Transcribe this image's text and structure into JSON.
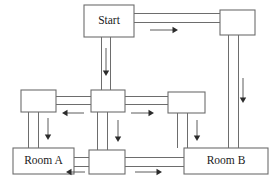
{
  "diagram": {
    "type": "floorplan-flow",
    "canvas": {
      "width": 275,
      "height": 182
    },
    "style": {
      "background_color": "#ffffff",
      "box_stroke_color": "#6d6d6d",
      "box_fill_color": "#ffffff",
      "corridor_color": "#6d6d6d",
      "arrow_color": "#2b2b2b",
      "label_color": "#1a1a1a"
    },
    "nodes": [
      {
        "id": "start",
        "label": "Start",
        "x": 84,
        "y": 5,
        "w": 50,
        "h": 32,
        "has_label": true
      },
      {
        "id": "top_right",
        "label": "",
        "x": 220,
        "y": 10,
        "w": 35,
        "h": 25,
        "has_label": false
      },
      {
        "id": "mid_left",
        "label": "",
        "x": 21,
        "y": 90,
        "w": 35,
        "h": 22,
        "has_label": false
      },
      {
        "id": "hub_center",
        "label": "",
        "x": 91,
        "y": 90,
        "w": 34,
        "h": 22,
        "has_label": false
      },
      {
        "id": "mid_right",
        "label": "",
        "x": 168,
        "y": 92,
        "w": 37,
        "h": 21,
        "has_label": false
      },
      {
        "id": "room_a",
        "label": "Room A",
        "x": 13,
        "y": 148,
        "w": 61,
        "h": 26,
        "has_label": true
      },
      {
        "id": "bottom_mid",
        "label": "",
        "x": 89,
        "y": 150,
        "w": 36,
        "h": 24,
        "has_label": false
      },
      {
        "id": "room_b",
        "label": "Room B",
        "x": 184,
        "y": 148,
        "w": 84,
        "h": 26,
        "has_label": true
      }
    ],
    "corridors": [
      {
        "id": "start-to-topright",
        "orientation": "horizontal",
        "a": 134,
        "b": 220,
        "t1": 13,
        "t2": 22
      },
      {
        "id": "start-to-hub",
        "orientation": "vertical",
        "a": 37,
        "b": 90,
        "t1": 101,
        "t2": 110
      },
      {
        "id": "topright-to-roomb",
        "orientation": "vertical",
        "a": 35,
        "b": 148,
        "t1": 228,
        "t2": 238
      },
      {
        "id": "midleft-to-hub",
        "orientation": "horizontal",
        "a": 56,
        "b": 91,
        "t1": 96,
        "t2": 104
      },
      {
        "id": "hub-to-midright",
        "orientation": "horizontal",
        "a": 125,
        "b": 168,
        "t1": 96,
        "t2": 104
      },
      {
        "id": "midleft-to-rooma",
        "orientation": "vertical",
        "a": 112,
        "b": 148,
        "t1": 28,
        "t2": 38
      },
      {
        "id": "hub-to-bottommid",
        "orientation": "vertical",
        "a": 112,
        "b": 150,
        "t1": 97,
        "t2": 107
      },
      {
        "id": "midright-to-roomb",
        "orientation": "vertical",
        "a": 113,
        "b": 148,
        "t1": 177,
        "t2": 187
      },
      {
        "id": "rooma-to-bottommid",
        "orientation": "horizontal",
        "a": 74,
        "b": 89,
        "t1": 157,
        "t2": 166
      },
      {
        "id": "bottommid-to-roomb",
        "orientation": "horizontal",
        "a": 125,
        "b": 184,
        "t1": 157,
        "t2": 166
      }
    ],
    "arrows": [
      {
        "id": "arrow-start-right",
        "direction": "right",
        "x1": 150,
        "y1": 30,
        "x2": 178,
        "y2": 30
      },
      {
        "id": "arrow-start-down",
        "direction": "down",
        "x1": 106,
        "y1": 48,
        "x2": 106,
        "y2": 76
      },
      {
        "id": "arrow-topright-down",
        "direction": "down",
        "x1": 243,
        "y1": 78,
        "x2": 243,
        "y2": 103
      },
      {
        "id": "arrow-hub-left",
        "direction": "left",
        "x1": 84,
        "y1": 113,
        "x2": 62,
        "y2": 113
      },
      {
        "id": "arrow-hub-right",
        "direction": "right",
        "x1": 131,
        "y1": 113,
        "x2": 154,
        "y2": 113
      },
      {
        "id": "arrow-midleft-down",
        "direction": "down",
        "x1": 48,
        "y1": 118,
        "x2": 48,
        "y2": 140
      },
      {
        "id": "arrow-hub-down",
        "direction": "down",
        "x1": 118,
        "y1": 120,
        "x2": 118,
        "y2": 142
      },
      {
        "id": "arrow-midright-down",
        "direction": "down",
        "x1": 197,
        "y1": 120,
        "x2": 197,
        "y2": 141
      },
      {
        "id": "arrow-bottom-left",
        "direction": "left",
        "x1": 85,
        "y1": 172,
        "x2": 66,
        "y2": 172
      },
      {
        "id": "arrow-bottom-right",
        "direction": "right",
        "x1": 135,
        "y1": 172,
        "x2": 162,
        "y2": 172
      }
    ]
  }
}
